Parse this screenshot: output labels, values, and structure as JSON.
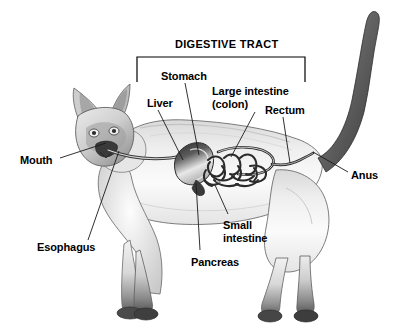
{
  "figure": {
    "title": "DIGESTIVE TRACT",
    "background_color": "#ffffff",
    "text_color": "#000000",
    "line_color": "#1a1a1a"
  },
  "bracket": {
    "name": "digestive-tract-bracket",
    "x1": 137,
    "x2": 305,
    "y_top": 57,
    "y_bottom": 82
  },
  "labels": [
    {
      "id": "mouth",
      "text": "Mouth",
      "x": 20,
      "y": 154,
      "lines": [
        "Mouth"
      ]
    },
    {
      "id": "esophagus",
      "text": "Esophagus",
      "x": 37,
      "y": 241,
      "lines": [
        "Esophagus"
      ]
    },
    {
      "id": "liver",
      "text": "Liver",
      "x": 147,
      "y": 97,
      "lines": [
        "Liver"
      ]
    },
    {
      "id": "stomach",
      "text": "Stomach",
      "x": 161,
      "y": 70,
      "lines": [
        "Stomach"
      ]
    },
    {
      "id": "large-intestine",
      "text": "Large intestine (colon)",
      "x": 212,
      "y": 85,
      "lines": [
        "Large intestine",
        "(colon)"
      ]
    },
    {
      "id": "rectum",
      "text": "Rectum",
      "x": 265,
      "y": 104,
      "lines": [
        "Rectum"
      ]
    },
    {
      "id": "anus",
      "text": "Anus",
      "x": 351,
      "y": 169,
      "lines": [
        "Anus"
      ]
    },
    {
      "id": "small-intestine",
      "text": "Small intestine",
      "x": 223,
      "y": 219,
      "lines": [
        "Small",
        "intestine"
      ]
    },
    {
      "id": "pancreas",
      "text": "Pancreas",
      "x": 191,
      "y": 256,
      "lines": [
        "Pancreas"
      ]
    }
  ],
  "leader_lines": [
    {
      "id": "mouth-leader",
      "from": [
        60,
        158
      ],
      "to": [
        106,
        143
      ]
    },
    {
      "id": "esophagus-leader",
      "from": [
        88,
        240
      ],
      "to": [
        119,
        151
      ]
    },
    {
      "id": "liver-leader",
      "from": [
        158,
        110
      ],
      "to": [
        183,
        160
      ]
    },
    {
      "id": "stomach-leader",
      "from": [
        185,
        83
      ],
      "to": [
        199,
        155
      ]
    },
    {
      "id": "large-intestine-leader",
      "from": [
        255,
        112
      ],
      "to": [
        231,
        157
      ]
    },
    {
      "id": "rectum-leader",
      "from": [
        283,
        117
      ],
      "to": [
        290,
        163
      ]
    },
    {
      "id": "anus-leader",
      "from": [
        348,
        172
      ],
      "to": [
        313,
        152
      ]
    },
    {
      "id": "small-intestine-leader",
      "from": [
        228,
        214
      ],
      "to": [
        215,
        185
      ]
    },
    {
      "id": "pancreas-leader",
      "from": [
        200,
        250
      ],
      "to": [
        196,
        183
      ]
    }
  ]
}
